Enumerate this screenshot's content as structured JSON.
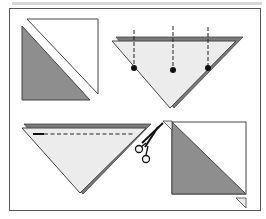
{
  "diagram": {
    "colors": {
      "frame": "#555555",
      "top_strip": "#d8d8d8",
      "dark_fill": "#8e8e8e",
      "light_fill": "#ececec",
      "paper_white": "#ffffff",
      "edge": "#444444",
      "accent_edge": "#7a7a7a"
    },
    "steps": [
      {
        "id": 1,
        "label": "square divided diagonally into two triangles"
      },
      {
        "id": 2,
        "label": "folded triangle with three pin marks"
      },
      {
        "id": 3,
        "label": "triangle with dashed cutting line and scissors"
      },
      {
        "id": 4,
        "label": "unfolded square with shaded half and corner tabs"
      }
    ]
  }
}
